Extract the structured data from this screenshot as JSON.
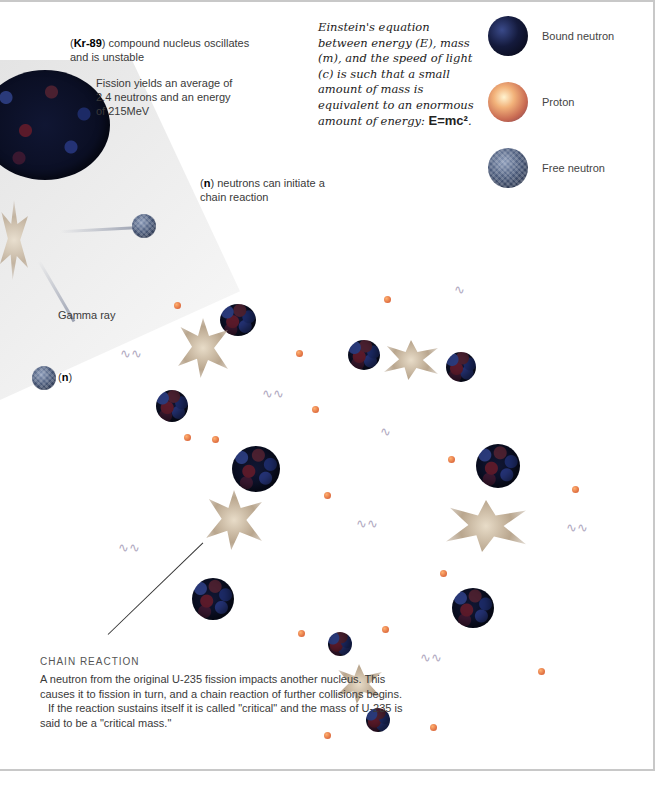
{
  "annotations": {
    "kr89_symbol": "Kr-89",
    "kr89_text": "compound nucleus oscillates and is unstable",
    "fission_yield": "Fission yields an average of 2.4 neutrons and an energy of 215MeV",
    "n_symbol": "n",
    "n_text": "neutrons can initiate a chain reaction",
    "gamma_ray": "Gamma ray",
    "n_label": "n"
  },
  "einstein": {
    "text": "Einstein's equation between energy (E), mass (m), and the speed of light (c) is such that a small amount of mass is equivalent to an enormous amount of energy: ",
    "equation": "E=mc²",
    "end": "."
  },
  "legend": {
    "items": [
      {
        "label": "Bound neutron",
        "icon": "bound-neutron-sphere",
        "color": "#141a3c"
      },
      {
        "label": "Proton",
        "icon": "proton-sphere",
        "color": "#f2b27a"
      },
      {
        "label": "Free neutron",
        "icon": "free-neutron-sphere",
        "color": "#4a5a7a"
      }
    ]
  },
  "chain_reaction": {
    "title": "CHAIN REACTION",
    "paragraph_1": "A neutron from the original U-235 fission impacts another nucleus. This causes it to fission in turn, and a chain reaction of further collisions begins.",
    "paragraph_2": "If the reaction sustains itself it is called \"critical\" and the mass of U-235 is said to be a \"critical mass.\""
  }
}
